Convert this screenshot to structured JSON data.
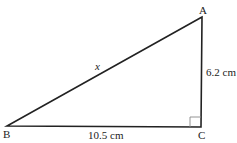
{
  "diagram": {
    "type": "right-triangle",
    "vertices": {
      "A": {
        "label": "A",
        "x": 202,
        "y": 17
      },
      "B": {
        "label": "B",
        "x": 7,
        "y": 126
      },
      "C": {
        "label": "C",
        "x": 201,
        "y": 127
      }
    },
    "right_angle_at": "C",
    "sides": {
      "AB": {
        "label": "x"
      },
      "AC": {
        "label": "6.2 cm"
      },
      "BC": {
        "label": "10.5 cm"
      }
    },
    "colors": {
      "stroke": "#222222",
      "background": "#ffffff",
      "marker": "#888888"
    }
  }
}
